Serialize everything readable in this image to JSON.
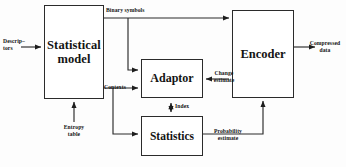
{
  "diagram": {
    "type": "block-diagram",
    "stroke_color": "#2b2b2b",
    "text_color": "#141414",
    "background": "#fdfdfd",
    "nodes": [
      {
        "id": "statistical_model",
        "label": "Statistical\nmodel"
      },
      {
        "id": "encoder",
        "label": "Encoder"
      },
      {
        "id": "adaptor",
        "label": "Adaptor"
      },
      {
        "id": "statistics",
        "label": "Statistics"
      }
    ],
    "edge_labels": {
      "descriptors": "Descrip–\ntors",
      "binary_symbols": "Binary symbols",
      "contexts": "Contexts",
      "entropy_table": "Entropy\ntable",
      "index": "Index",
      "change_estimate": "Change\nestimate",
      "probability_estimate": "Probability\nestimate",
      "compressed_data": "Compressed\ndata"
    },
    "edges": [
      {
        "from": "input",
        "to": "statistical_model",
        "label": "Descrip–tors",
        "arrow": "single"
      },
      {
        "from": "statistical_model",
        "to": "encoder",
        "label": "Binary symbols",
        "arrow": "single"
      },
      {
        "from": "statistical_model",
        "to": "adaptor",
        "label": "Binary symbols",
        "arrow": "single"
      },
      {
        "from": "statistical_model",
        "to": "adaptor",
        "label": "Contexts",
        "arrow": "single"
      },
      {
        "from": "statistical_model",
        "to": "statistics",
        "label": "Contexts",
        "arrow": "single"
      },
      {
        "from": "entropy_table",
        "to": "statistical_model",
        "label": "Entropy table",
        "arrow": "single"
      },
      {
        "from": "adaptor",
        "to": "statistics",
        "label": "Index",
        "arrow": "double"
      },
      {
        "from": "encoder",
        "to": "adaptor",
        "label": "Change estimate",
        "arrow": "single"
      },
      {
        "from": "statistics",
        "to": "encoder",
        "label": "Probability estimate",
        "arrow": "single"
      },
      {
        "from": "encoder",
        "to": "output",
        "label": "Compressed data",
        "arrow": "single"
      }
    ]
  }
}
